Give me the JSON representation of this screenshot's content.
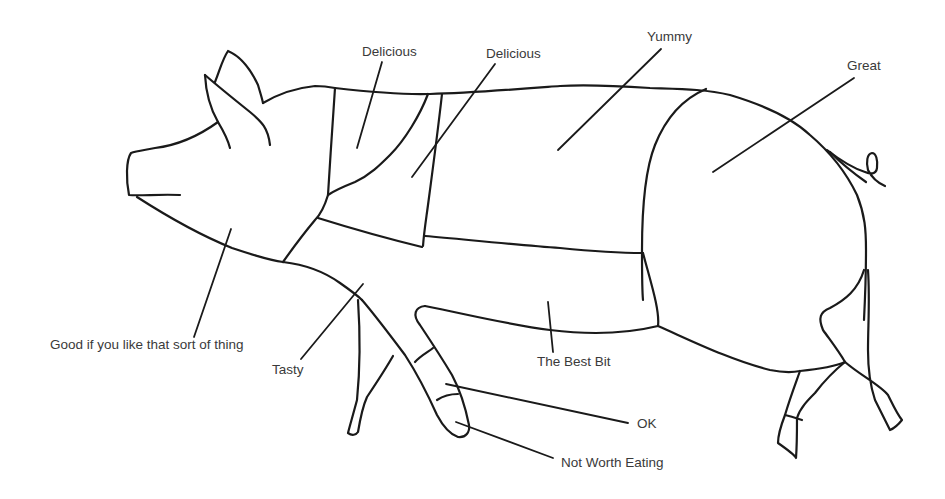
{
  "diagram": {
    "line_color": "#1a1a1a",
    "text_color": "#3a3a3a",
    "labels": [
      {
        "id": "neck",
        "text": "Delicious"
      },
      {
        "id": "shoulder-top",
        "text": "Delicious"
      },
      {
        "id": "loin",
        "text": "Yummy"
      },
      {
        "id": "ham",
        "text": "Great"
      },
      {
        "id": "head",
        "text": "Good if you like that sort of thing"
      },
      {
        "id": "front-leg",
        "text": "Tasty"
      },
      {
        "id": "belly",
        "text": "The Best Bit"
      },
      {
        "id": "trotter-upper",
        "text": "OK"
      },
      {
        "id": "trotter-lower",
        "text": "Not Worth Eating"
      }
    ]
  }
}
